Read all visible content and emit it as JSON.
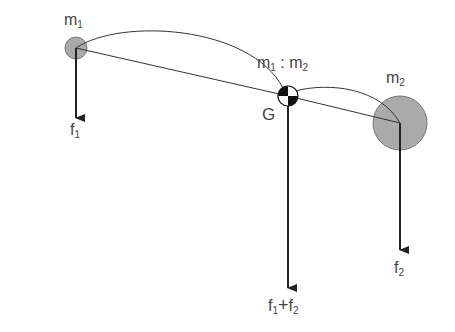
{
  "diagram": {
    "colors": {
      "line": "#333333",
      "mass_fill": "#aaaaaa",
      "mass_stroke": "#777777",
      "arrow": "#222222",
      "text": "#444444",
      "cg_black": "#111111",
      "cg_white": "#ffffff"
    },
    "nodes": [
      {
        "id": "m1",
        "label": "m",
        "sub": "1",
        "x": 76,
        "y": 48,
        "r": 11
      },
      {
        "id": "G",
        "label": "G",
        "x": 288,
        "y": 96,
        "r": 10
      },
      {
        "id": "m2",
        "label": "m",
        "sub": "2",
        "x": 400,
        "y": 123,
        "r": 27
      }
    ],
    "forces": [
      {
        "id": "f1",
        "label": "f",
        "sub": "1",
        "x": 76,
        "from_y": 48,
        "to_y": 118
      },
      {
        "id": "f1f2",
        "label": "f₁+f₂",
        "x": 288,
        "from_y": 96,
        "to_y": 288
      },
      {
        "id": "f2",
        "label": "f",
        "sub": "2",
        "x": 400,
        "from_y": 123,
        "to_y": 250
      }
    ],
    "labels": {
      "m1": "m",
      "m1_sub": "1",
      "m2": "m",
      "m2_sub": "2",
      "ratio_a": "m",
      "ratio_a_sub": "1",
      "ratio_sep": ":",
      "ratio_b": "m",
      "ratio_b_sub": "2",
      "g": "G",
      "f1": "f",
      "f1_sub": "1",
      "f2": "f",
      "f2_sub": "2",
      "sum_a": "f",
      "sum_a_sub": "1",
      "sum_op": "+",
      "sum_b": "f",
      "sum_b_sub": "2"
    }
  }
}
